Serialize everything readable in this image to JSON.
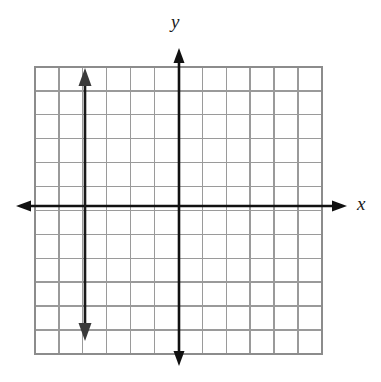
{
  "figure": {
    "kind": "cartesian-coordinate-plane",
    "background_color": "#ffffff",
    "grid": {
      "left_px": 35,
      "top_px": 67,
      "cell_px": 23.9,
      "columns": 12,
      "rows": 12,
      "line_color": "#9a9a9a",
      "border_color": "#8c8c8c",
      "line_width_px": 1.3,
      "show_grid": true
    },
    "axes": {
      "color": "#111111",
      "line_width_px": 2.6,
      "arrowheads": "both-ends",
      "x_axis": {
        "label": "x",
        "pixel_y": 206,
        "start_px": 16,
        "end_px": 347,
        "graph_value": 0
      },
      "y_axis": {
        "label": "y",
        "pixel_x": 179,
        "start_px": 48,
        "end_px": 366,
        "graph_value": 0
      }
    }
  },
  "labels": {
    "x": "x",
    "y": "y"
  },
  "chart_data": {
    "type": "line",
    "title": "",
    "xlabel": "x",
    "ylabel": "y",
    "grid": true,
    "legend": "none",
    "xlim": [
      -6,
      6
    ],
    "ylim": [
      -6,
      6
    ],
    "xticks": [
      -6,
      -5,
      -4,
      -3,
      -2,
      -1,
      0,
      1,
      2,
      3,
      4,
      5,
      6
    ],
    "yticks": [
      -6,
      -5,
      -4,
      -3,
      -2,
      -1,
      0,
      1,
      2,
      3,
      4,
      5,
      6
    ],
    "tick_labels_shown": false,
    "series": [
      {
        "name": "vertical line",
        "equation": "x = -4",
        "type": "vertical-line",
        "x": -4,
        "y_from": 5.5,
        "y_to": -5.5,
        "color": "#1a1a1a",
        "arrowheads": "both-ends",
        "pixel_x": 85,
        "pixel_y_top": 68,
        "pixel_y_bottom": 341
      }
    ]
  }
}
